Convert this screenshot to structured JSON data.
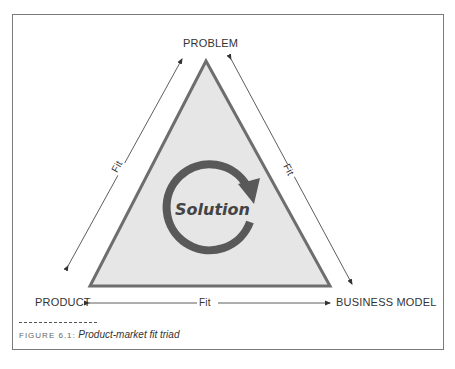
{
  "diagram": {
    "vertices": {
      "top": "PROBLEM",
      "bottom_left": "PRODUCT",
      "bottom_right": "BUSINESS MODEL"
    },
    "edges": {
      "left": "Fit",
      "right": "Fit",
      "bottom": "Fit"
    },
    "center_label": "Solution",
    "center_icon": "cycle-arrow-icon",
    "colors": {
      "triangle_fill": "#e6e6e6",
      "triangle_stroke": "#6e6e6e",
      "cycle": "#595959",
      "arrows": "#333333"
    }
  },
  "caption": {
    "figure_number": "FIGURE 6.1:",
    "title": "Product-market fit triad"
  }
}
